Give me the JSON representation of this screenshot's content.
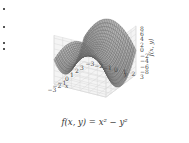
{
  "chart_data": {
    "type": "surface3d",
    "title": "f(x, y) = x² − y²",
    "function": "x^2 - y^2",
    "xlabel": "x",
    "ylabel": "y",
    "zlabel": "f(x, y)",
    "x_ticks": [
      "-3",
      "-2",
      "-1",
      "0",
      "1",
      "2",
      "3"
    ],
    "y_ticks": [
      "-3",
      "-2",
      "-1",
      "0",
      "1",
      "2",
      "3"
    ],
    "z_ticks": [
      "-8",
      "-6",
      "-4",
      "-2",
      "0",
      "2",
      "4",
      "6",
      "8"
    ],
    "xlim": [
      -3,
      3
    ],
    "ylim": [
      -3,
      3
    ],
    "zlim": [
      -9,
      9
    ],
    "grid": true,
    "style": "wireframe surface, gray"
  },
  "caption": "f(x,  y) = x² − y²",
  "colors": {
    "surface": "#8a8a8a",
    "wire": "#5a5a5a",
    "grid": "#d8d8d8",
    "pane": "#f4f4f4"
  }
}
